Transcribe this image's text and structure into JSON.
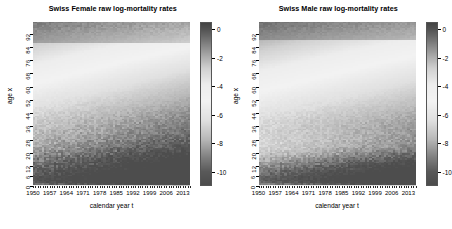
{
  "figure": {
    "width": 451,
    "height": 229,
    "background": "#ffffff"
  },
  "chart_data": [
    {
      "type": "heatmap",
      "title": "Swiss Female raw log-mortality rates",
      "xlabel": "calendar year t",
      "ylabel": "age x",
      "xlim": [
        1950,
        2016
      ],
      "ylim": [
        0,
        99
      ],
      "xticks": [
        1950,
        1957,
        1964,
        1971,
        1978,
        1985,
        1992,
        1999,
        2006,
        2013
      ],
      "yticks": [
        0,
        6,
        12,
        20,
        28,
        36,
        44,
        52,
        60,
        68,
        76,
        84,
        92
      ],
      "grid": false,
      "colormap": "grayscale",
      "colorbar": {
        "label": "",
        "ticks": [
          0,
          -2,
          -4,
          -6,
          -8,
          -10
        ],
        "vmin": -11,
        "vmax": 0.5,
        "position": "right"
      },
      "z_description": "log-mortality rate log(m(t,x)) by calendar year t (x-axis) and age x (y-axis); dark = high mortality at very old ages (top band) and dark = very low mortality at young/mid ages (bottom band), light = mid-range values.",
      "bands": [
        {
          "age_range": [
            84,
            99
          ],
          "value_range": [
            -1.2,
            0.0
          ],
          "note": "dark band, highest mortality, oldest ages"
        },
        {
          "age_range": [
            72,
            84
          ],
          "value_range": [
            -2.6,
            -1.2
          ],
          "note": "bright transition band"
        },
        {
          "age_range": [
            40,
            72
          ],
          "value_range": [
            -5.5,
            -2.6
          ],
          "note": "light grey mid-age plateau"
        },
        {
          "age_range": [
            12,
            40
          ],
          "value_range": [
            -9.0,
            -6.0
          ],
          "note": "dark noisy band, darkening over time"
        },
        {
          "age_range": [
            0,
            12
          ],
          "value_range": [
            -7.0,
            -5.0
          ],
          "note": "infant mortality, lighter near 1950 and darker later"
        }
      ]
    },
    {
      "type": "heatmap",
      "title": "Swiss Male raw log-mortality rates",
      "xlabel": "calendar year t",
      "ylabel": "age x",
      "xlim": [
        1950,
        2016
      ],
      "ylim": [
        0,
        99
      ],
      "xticks": [
        1950,
        1957,
        1964,
        1971,
        1978,
        1985,
        1992,
        1999,
        2006,
        2013
      ],
      "yticks": [
        0,
        6,
        12,
        20,
        28,
        36,
        44,
        52,
        60,
        68,
        76,
        84,
        92
      ],
      "grid": false,
      "colormap": "grayscale",
      "colorbar": {
        "label": "",
        "ticks": [
          0,
          -2,
          -4,
          -6,
          -8,
          -10
        ],
        "vmin": -11,
        "vmax": 0.5,
        "position": "right"
      },
      "z_description": "log-mortality rate log(m(t,x)) by calendar year t (x-axis) and age x (y-axis); males show a darker low-mortality wedge emerging at ages 20-40 after about 1999.",
      "bands": [
        {
          "age_range": [
            86,
            99
          ],
          "value_range": [
            -1.1,
            0.0
          ],
          "note": "dark band, highest mortality, oldest ages"
        },
        {
          "age_range": [
            74,
            86
          ],
          "value_range": [
            -2.4,
            -1.1
          ],
          "note": "bright transition band"
        },
        {
          "age_range": [
            42,
            74
          ],
          "value_range": [
            -5.2,
            -2.4
          ],
          "note": "light grey mid-age plateau"
        },
        {
          "age_range": [
            20,
            42
          ],
          "value_range": [
            -7.5,
            -5.0
          ],
          "note": "mid-grey, darkening wedge after 1999"
        },
        {
          "age_range": [
            0,
            16
          ],
          "value_range": [
            -9.5,
            -6.5
          ],
          "note": "dark noisy band across all years"
        }
      ]
    }
  ],
  "panels": [
    {
      "name": "female",
      "title": "Swiss Female raw log-mortality rates",
      "xlabel": "calendar year t",
      "ylabel": "age x",
      "xtick_labels": [
        "1950",
        "1957",
        "1964",
        "1971",
        "1978",
        "1985",
        "1992",
        "1999",
        "2006",
        "2013"
      ],
      "ytick_labels": [
        "0",
        "6",
        "12",
        "20",
        "28",
        "36",
        "44",
        "52",
        "60",
        "68",
        "76",
        "84",
        "92"
      ],
      "colorbar_labels": [
        "0",
        "-2",
        "-4",
        "-6",
        "-8",
        "-10"
      ]
    },
    {
      "name": "male",
      "title": "Swiss Male raw log-mortality rates",
      "xlabel": "calendar year t",
      "ylabel": "age x",
      "xtick_labels": [
        "1950",
        "1957",
        "1964",
        "1971",
        "1978",
        "1985",
        "1992",
        "1999",
        "2006",
        "2013"
      ],
      "ytick_labels": [
        "0",
        "6",
        "12",
        "20",
        "28",
        "36",
        "44",
        "52",
        "60",
        "68",
        "76",
        "84",
        "92"
      ],
      "colorbar_labels": [
        "0",
        "-2",
        "-4",
        "-6",
        "-8",
        "-10"
      ]
    }
  ],
  "colors": {
    "axis": "#000000",
    "text": "#000000",
    "background": "#ffffff",
    "cbar_dark": "#3d3d3d",
    "cbar_light": "#f2f2f2"
  }
}
